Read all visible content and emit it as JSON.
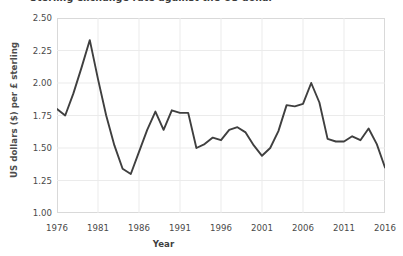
{
  "chart_data": {
    "type": "line",
    "title": "Sterling exchange rate against the US dollar",
    "xlabel": "Year",
    "ylabel": "US dollars ($) per £ sterling",
    "xlim": [
      1976,
      2016
    ],
    "ylim": [
      1.0,
      2.5
    ],
    "ytick_labels": [
      "1.00",
      "1.25",
      "1.50",
      "1.75",
      "2.00",
      "2.25",
      "2.50"
    ],
    "ytick_values": [
      1.0,
      1.25,
      1.5,
      1.75,
      2.0,
      2.25,
      2.5
    ],
    "xtick_labels": [
      "1976",
      "1981",
      "1986",
      "1991",
      "1996",
      "2001",
      "2006",
      "2011",
      "2016"
    ],
    "xtick_values": [
      1976,
      1981,
      1986,
      1991,
      1996,
      2001,
      2006,
      2011,
      2016
    ],
    "grid": true,
    "legend": false,
    "line_color": "#3f3f3f",
    "line_width": 1.9,
    "x": [
      1976,
      1977,
      1978,
      1979,
      1980,
      1981,
      1982,
      1983,
      1984,
      1985,
      1986,
      1987,
      1988,
      1989,
      1990,
      1991,
      1992,
      1993,
      1994,
      1995,
      1996,
      1997,
      1998,
      1999,
      2000,
      2001,
      2002,
      2003,
      2004,
      2005,
      2006,
      2007,
      2008,
      2009,
      2010,
      2011,
      2012,
      2013,
      2014,
      2015,
      2016
    ],
    "values": [
      1.8,
      1.75,
      1.92,
      2.12,
      2.33,
      2.03,
      1.75,
      1.52,
      1.34,
      1.3,
      1.47,
      1.64,
      1.78,
      1.64,
      1.79,
      1.77,
      1.77,
      1.5,
      1.53,
      1.58,
      1.56,
      1.64,
      1.66,
      1.62,
      1.52,
      1.44,
      1.5,
      1.63,
      1.83,
      1.82,
      1.84,
      2.0,
      1.85,
      1.57,
      1.55,
      1.55,
      1.59,
      1.56,
      1.65,
      1.53,
      1.35
    ],
    "annotations": []
  }
}
